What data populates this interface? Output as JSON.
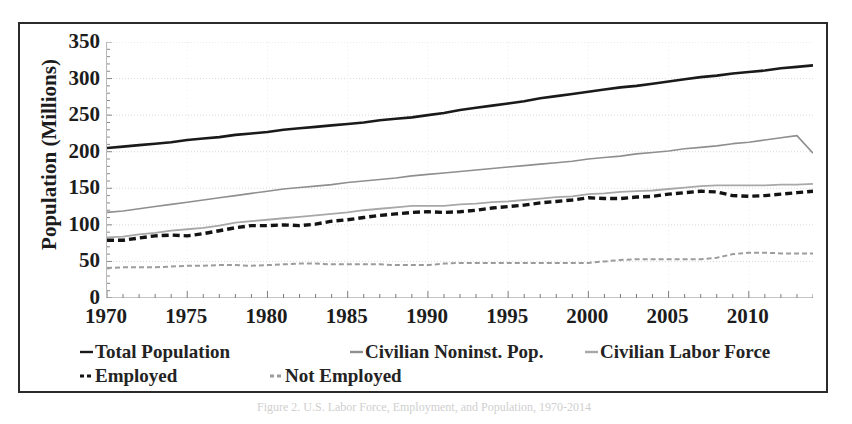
{
  "chart_data": {
    "type": "line",
    "title": "",
    "xlabel": "",
    "ylabel": "Population (Millions)",
    "xlim": [
      1970,
      2014
    ],
    "ylim": [
      0,
      350
    ],
    "yticks": [
      350,
      300,
      250,
      200,
      150,
      100,
      50,
      0
    ],
    "xticks": [
      1970,
      1975,
      1980,
      1985,
      1990,
      1995,
      2000,
      2005,
      2010
    ],
    "x_minor_tick_interval": 1,
    "grid": true,
    "grid_style": "dotted-light-gray",
    "legend_position": "below-axes",
    "x": [
      1970,
      1971,
      1972,
      1973,
      1974,
      1975,
      1976,
      1977,
      1978,
      1979,
      1980,
      1981,
      1982,
      1983,
      1984,
      1985,
      1986,
      1987,
      1988,
      1989,
      1990,
      1991,
      1992,
      1993,
      1994,
      1995,
      1996,
      1997,
      1998,
      1999,
      2000,
      2001,
      2002,
      2003,
      2004,
      2005,
      2006,
      2007,
      2008,
      2009,
      2010,
      2011,
      2012,
      2013,
      2014
    ],
    "series": [
      {
        "name": "Total Population",
        "color": "#1a1a1a",
        "style": "solid",
        "width": 2.6,
        "values": [
          205,
          207,
          209,
          211,
          213,
          216,
          218,
          220,
          223,
          225,
          227,
          230,
          232,
          234,
          236,
          238,
          240,
          243,
          245,
          247,
          250,
          253,
          257,
          260,
          263,
          266,
          269,
          273,
          276,
          279,
          282,
          285,
          288,
          290,
          293,
          296,
          299,
          302,
          304,
          307,
          309,
          311,
          314,
          316,
          318
        ]
      },
      {
        "name": "Civilian Noninst. Pop.",
        "color": "#8f8f8f",
        "style": "solid",
        "width": 1.6,
        "values": [
          117,
          119,
          122,
          125,
          128,
          131,
          134,
          137,
          140,
          143,
          146,
          149,
          151,
          153,
          155,
          158,
          160,
          162,
          164,
          167,
          169,
          171,
          173,
          175,
          177,
          179,
          181,
          183,
          185,
          187,
          190,
          192,
          194,
          197,
          199,
          201,
          204,
          206,
          208,
          211,
          213,
          216,
          219,
          222,
          198
        ]
      },
      {
        "name": "Civilian Labor Force",
        "color": "#a8a8a8",
        "style": "solid",
        "width": 1.8,
        "values": [
          83,
          84,
          87,
          89,
          92,
          94,
          96,
          99,
          103,
          105,
          107,
          109,
          111,
          113,
          115,
          117,
          120,
          122,
          124,
          126,
          126,
          126,
          128,
          129,
          131,
          132,
          134,
          136,
          138,
          139,
          142,
          143,
          145,
          146,
          147,
          149,
          151,
          153,
          154,
          154,
          154,
          154,
          155,
          155,
          156
        ]
      },
      {
        "name": "Employed",
        "color": "#131313",
        "style": "dashed",
        "width": 3.4,
        "values": [
          79,
          79,
          82,
          85,
          86,
          85,
          88,
          92,
          96,
          99,
          99,
          100,
          99,
          101,
          105,
          107,
          110,
          113,
          115,
          117,
          118,
          117,
          118,
          120,
          123,
          125,
          127,
          130,
          132,
          134,
          137,
          136,
          136,
          138,
          139,
          142,
          144,
          146,
          145,
          140,
          139,
          140,
          142,
          144,
          146
        ]
      },
      {
        "name": "Not Employed",
        "color": "#9c9c9c",
        "style": "dashed",
        "width": 2.0,
        "values": [
          41,
          42,
          42,
          42,
          43,
          44,
          44,
          45,
          45,
          44,
          45,
          46,
          47,
          47,
          46,
          46,
          46,
          46,
          45,
          45,
          45,
          47,
          48,
          48,
          48,
          48,
          48,
          48,
          48,
          48,
          48,
          50,
          52,
          53,
          53,
          53,
          53,
          53,
          55,
          60,
          62,
          62,
          61,
          61,
          61
        ]
      }
    ]
  },
  "axis": {
    "y_title": "Population (Millions)",
    "y_tick_labels": [
      "350",
      "300",
      "250",
      "200",
      "150",
      "100",
      "50",
      "0"
    ],
    "x_tick_labels": [
      "1970",
      "1975",
      "1980",
      "1985",
      "1990",
      "1995",
      "2000",
      "2005",
      "2010"
    ]
  },
  "legend": {
    "row1": [
      {
        "label": "Total Population",
        "color": "#1a1a1a",
        "style": "solid"
      },
      {
        "label": "Civilian Noninst. Pop.",
        "color": "#8f8f8f",
        "style": "solid"
      },
      {
        "label": "Civilian Labor Force",
        "color": "#a8a8a8",
        "style": "solid"
      }
    ],
    "row2": [
      {
        "label": "Employed",
        "color": "#131313",
        "style": "dashed"
      },
      {
        "label": "Not Employed",
        "color": "#9c9c9c",
        "style": "dashed"
      }
    ]
  },
  "caption": {
    "text": "Figure 2. U.S. Labor Force, Employment, and Population, 1970-2014"
  },
  "colors": {
    "frame": "#2b2b2b",
    "text": "#1c1c1c",
    "grid": "#d9d9d9",
    "background": "#ffffff"
  }
}
